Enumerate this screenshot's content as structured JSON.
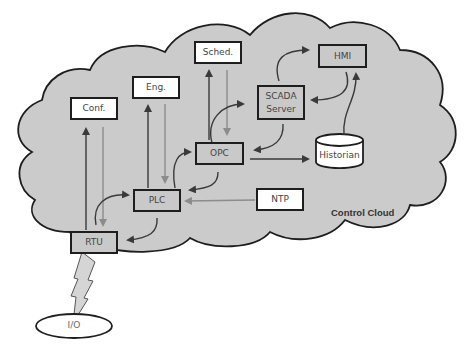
{
  "diagram": {
    "cloud_label": "Control Cloud",
    "colors": {
      "cloud_fill": "#cbcbcb",
      "outline": "#1e1e1e",
      "dark_arrow": "#3a3a3a",
      "light_arrow": "#8c8c8c",
      "box_gray": "#c9c9c9",
      "box_white": "#ffffff"
    },
    "nodes": [
      {
        "id": "conf",
        "label": "Conf.",
        "style": "white"
      },
      {
        "id": "eng",
        "label": "Eng.",
        "style": "white"
      },
      {
        "id": "sched",
        "label": "Sched.",
        "style": "white"
      },
      {
        "id": "hmi",
        "label": "HMI",
        "style": "gray"
      },
      {
        "id": "scada",
        "label": "SCADA Server",
        "line1": "SCADA",
        "line2": "Server",
        "style": "gray"
      },
      {
        "id": "opc",
        "label": "OPC",
        "style": "gray"
      },
      {
        "id": "historian",
        "label": "Historian",
        "style": "white-cylinder"
      },
      {
        "id": "plc",
        "label": "PLC",
        "style": "gray"
      },
      {
        "id": "ntp",
        "label": "NTP",
        "style": "white"
      },
      {
        "id": "rtu",
        "label": "RTU",
        "style": "gray"
      },
      {
        "id": "io",
        "label": "I/O",
        "style": "white-ellipse"
      }
    ],
    "edges": [
      {
        "from": "rtu",
        "to": "conf",
        "shade": "dark"
      },
      {
        "from": "conf",
        "to": "rtu",
        "shade": "light"
      },
      {
        "from": "plc",
        "to": "eng",
        "shade": "dark"
      },
      {
        "from": "eng",
        "to": "plc",
        "shade": "light"
      },
      {
        "from": "opc",
        "to": "sched",
        "shade": "dark"
      },
      {
        "from": "sched",
        "to": "opc",
        "shade": "light"
      },
      {
        "from": "rtu",
        "to": "plc",
        "shade": "dark",
        "curved": true
      },
      {
        "from": "plc",
        "to": "rtu",
        "shade": "dark",
        "curved": true
      },
      {
        "from": "plc",
        "to": "opc",
        "shade": "dark",
        "curved": true
      },
      {
        "from": "opc",
        "to": "plc",
        "shade": "dark",
        "curved": true
      },
      {
        "from": "opc",
        "to": "scada",
        "shade": "dark",
        "curved": true
      },
      {
        "from": "scada",
        "to": "opc",
        "shade": "dark",
        "curved": true
      },
      {
        "from": "scada",
        "to": "hmi",
        "shade": "dark",
        "curved": true
      },
      {
        "from": "hmi",
        "to": "scada",
        "shade": "dark",
        "curved": true
      },
      {
        "from": "historian",
        "to": "hmi",
        "shade": "dark",
        "curved": true
      },
      {
        "from": "opc",
        "to": "historian",
        "shade": "dark"
      },
      {
        "from": "ntp",
        "to": "plc",
        "shade": "light"
      },
      {
        "from": "rtu",
        "to": "io",
        "shade": "wireless"
      }
    ]
  }
}
